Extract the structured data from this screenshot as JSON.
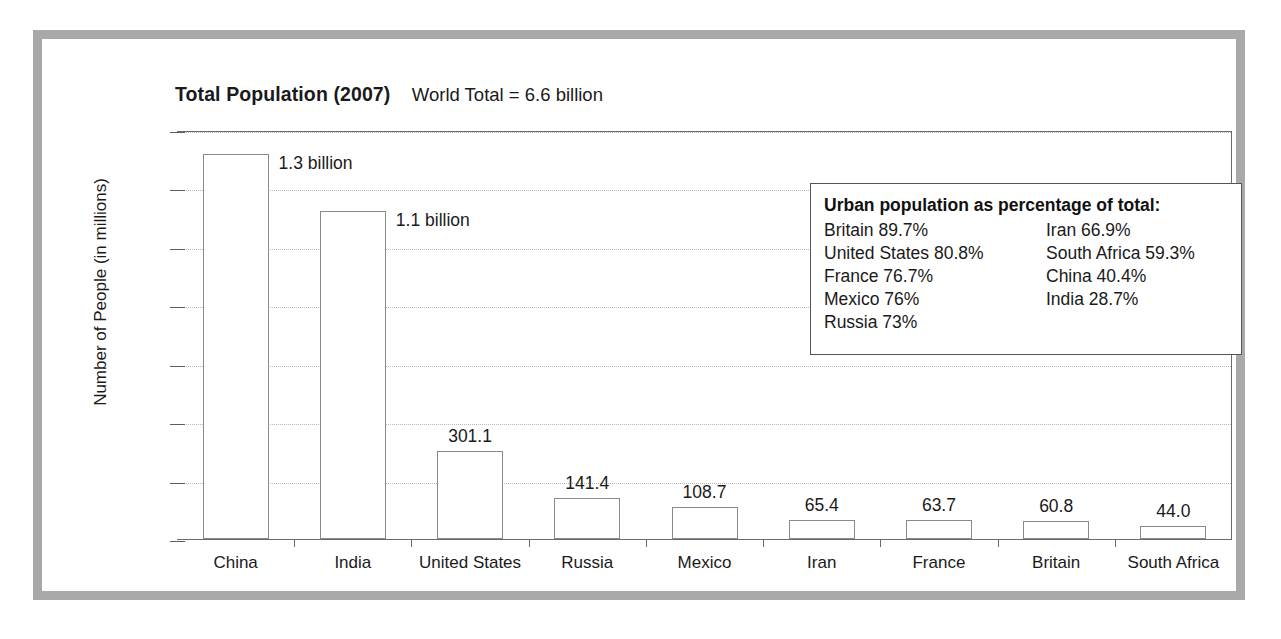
{
  "chart_data": {
    "type": "bar",
    "title": "Total Population (2007)",
    "subtitle": "World Total = 6.6 billion",
    "xlabel": "",
    "ylabel": "Number of People (in millions)",
    "ylim": [
      0,
      1400
    ],
    "yticks": [
      0,
      200,
      400,
      600,
      800,
      1000,
      1200,
      1400
    ],
    "ytick_labels": [
      "0",
      "200",
      "400",
      "600",
      "800",
      "1,000",
      "1,200",
      "1,400"
    ],
    "grid": true,
    "legend_position": "inside-top-right",
    "categories": [
      "China",
      "India",
      "United States",
      "Russia",
      "Mexico",
      "Iran",
      "France",
      "Britain",
      "South Africa"
    ],
    "values": [
      1318,
      1123,
      301.1,
      141.4,
      108.7,
      65.4,
      63.7,
      60.8,
      44.0
    ],
    "data_labels": [
      "1.3 billion",
      "1.1 billion",
      "301.1",
      "141.4",
      "108.7",
      "65.4",
      "63.7",
      "60.8",
      "44.0"
    ],
    "label_placement": [
      "right-of-bar",
      "right-of-bar",
      "above",
      "above",
      "above",
      "above",
      "above",
      "above",
      "above"
    ],
    "annotations": {
      "legend_title": "Urban population as percentage of total:",
      "legend_column_left": [
        "Britain 89.7%",
        "United States 80.8%",
        "France 76.7%",
        "Mexico 76%",
        "Russia 73%"
      ],
      "legend_column_right": [
        "Iran 66.9%",
        "South Africa 59.3%",
        "China 40.4%",
        "India 28.7%"
      ]
    },
    "colors": {
      "bar_fill": "#ffffff",
      "bar_stroke": "#8a8a8a",
      "gridline": "#b9b9b9",
      "axis": "#5d5d5d",
      "frame": "#a9a9a9",
      "text": "#1a1a1a",
      "background": "#ffffff"
    }
  }
}
